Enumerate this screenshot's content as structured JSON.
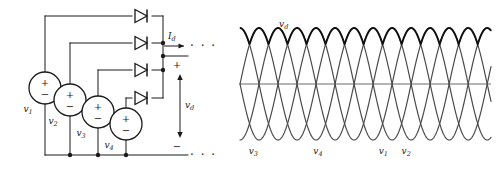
{
  "figure": {
    "stroke_color": "#1a1a1a",
    "wave_color": "#4a4a4a",
    "envelope_color": "#101010",
    "axis_color": "#6a6a6a"
  },
  "circuit": {
    "sources": [
      {
        "id": "v1",
        "label": "v",
        "subscript": "1",
        "plus": "+",
        "minus": "−",
        "cx": 45,
        "cy": 88,
        "r": 16
      },
      {
        "id": "v2",
        "label": "v",
        "subscript": "2",
        "plus": "+",
        "minus": "−",
        "cx": 70,
        "cy": 100,
        "r": 16
      },
      {
        "id": "v3",
        "label": "v",
        "subscript": "3",
        "plus": "+",
        "minus": "−",
        "cx": 98,
        "cy": 112,
        "r": 16
      },
      {
        "id": "v4",
        "label": "v",
        "subscript": "4",
        "plus": "+",
        "minus": "−",
        "cx": 126,
        "cy": 124,
        "r": 16
      }
    ],
    "diodes": [
      {
        "id": "d1",
        "y": 16
      },
      {
        "id": "d2",
        "y": 43
      },
      {
        "id": "d3",
        "y": 70
      },
      {
        "id": "d4",
        "y": 98
      }
    ],
    "output_current": {
      "label": "I",
      "subscript": "d"
    },
    "output_voltage": {
      "label": "v",
      "subscript": "d"
    },
    "terminal_plus": "+",
    "terminal_minus": "−",
    "continuation_marks": "· · ·"
  },
  "chart_data": {
    "type": "line",
    "title": "",
    "xlabel": "",
    "ylabel": "",
    "grid": false,
    "legend": "inline-annotations",
    "axis_line_y": 0,
    "ylim": [
      -1.15,
      1.15
    ],
    "xlim": [
      0,
      6.6
    ],
    "amplitude": 1.0,
    "period": 2.0,
    "phase_labels": [
      "v_3",
      "v_4",
      "v_1",
      "v_2"
    ],
    "series": [
      {
        "name": "v1",
        "label": "v",
        "sublabel": "1",
        "phase_deg": 180,
        "color": "#4a4a4a",
        "annotation_x": 3.77,
        "annotation_y": -1.0
      },
      {
        "name": "v2",
        "label": "v",
        "sublabel": "2",
        "phase_deg": 270,
        "color": "#4a4a4a",
        "annotation_x": 4.37,
        "annotation_y": -1.0
      },
      {
        "name": "v3",
        "label": "v",
        "sublabel": "3",
        "phase_deg": 0,
        "color": "#4a4a4a",
        "annotation_x": 0.35,
        "annotation_y": -1.0
      },
      {
        "name": "v4",
        "label": "v",
        "sublabel": "4",
        "phase_deg": 90,
        "color": "#4a4a4a",
        "annotation_x": 2.05,
        "annotation_y": -1.0
      }
    ],
    "envelope": {
      "name": "vd",
      "label": "v",
      "sublabel": "d",
      "description": "maximum of the four phase voltages (rectified output)",
      "color": "#101010",
      "annotation_x": 1.15,
      "annotation_y": 1.12
    }
  }
}
